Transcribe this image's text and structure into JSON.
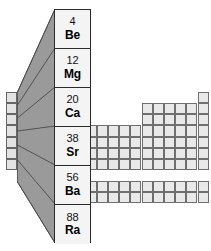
{
  "diagram": {
    "colors": {
      "callout_fill": "#9a9a9a",
      "callout_stroke": "#5a5a5a",
      "cell_fill": "#e9e9e9",
      "cell_stroke": "#6f6f6f",
      "magnified_fill": "#f4f4f4",
      "magnified_stroke": "#2b2b2b",
      "text": "#000000",
      "background": "#ffffff"
    }
  },
  "magnified_group": {
    "label": "Group 2",
    "elements": [
      {
        "number": "4",
        "symbol": "Be"
      },
      {
        "number": "12",
        "symbol": "Mg"
      },
      {
        "number": "20",
        "symbol": "Ca"
      },
      {
        "number": "38",
        "symbol": "Sr"
      },
      {
        "number": "56",
        "symbol": "Ba"
      },
      {
        "number": "88",
        "symbol": "Ra"
      }
    ]
  },
  "mini_table": {
    "highlighted_column_label": "Group 2",
    "highlighted_cell_count": 7,
    "geometry": {
      "cell_w": 11.2,
      "cell_h": 11.2,
      "origin_x": 6,
      "origin_y": 4,
      "group2_column_index": 1
    },
    "rows": [
      {
        "row": "1",
        "cells": [
          [
            1,
            1
          ]
        ]
      },
      {
        "row": "2",
        "cells": [
          [
            1,
            1
          ]
        ]
      },
      {
        "row": "3",
        "cells": [
          [
            1,
            1
          ]
        ]
      },
      {
        "row": "4",
        "cells": [
          [
            1,
            1
          ]
        ]
      },
      {
        "row": "5",
        "cells": [
          [
            1,
            1
          ]
        ]
      },
      {
        "row": "6",
        "cells": [
          [
            1,
            1
          ]
        ]
      },
      {
        "row": "7",
        "cells": [
          [
            1,
            1
          ]
        ]
      }
    ]
  },
  "chart_data": {
    "type": "table",
    "categories": [
      "Be",
      "Mg",
      "Ca",
      "Sr",
      "Ba",
      "Ra"
    ],
    "values": [
      4,
      12,
      20,
      38,
      56,
      88
    ],
    "xlabel": "Element symbol",
    "ylabel": "Atomic number",
    "annotations": [
      "Group 2 column is magnified via a trapezoidal callout",
      "Main periodic table block shown unlabeled at right",
      "Separate f-block row shown at bottom"
    ]
  }
}
